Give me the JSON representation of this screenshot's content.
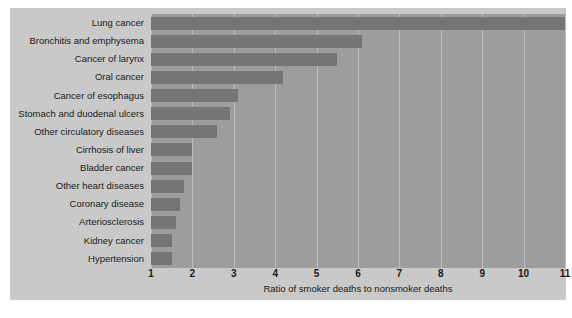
{
  "chart_data": {
    "type": "bar",
    "orientation": "horizontal",
    "title": "",
    "xlabel": "Ratio of smoker deaths to nonsmoker deaths",
    "ylabel": "",
    "xlim": [
      1,
      11
    ],
    "xticks": [
      "1",
      "2",
      "3",
      "4",
      "5",
      "6",
      "7",
      "8",
      "9",
      "10",
      "11"
    ],
    "grid": "vertical",
    "legend": "none",
    "categories": [
      "Lung cancer",
      "Bronchitis and emphysema",
      "Cancer of larynx",
      "Oral cancer",
      "Cancer of esophagus",
      "Stomach and duodenal ulcers",
      "Other circulatory diseases",
      "Cirrhosis of liver",
      "Bladder cancer",
      "Other heart diseases",
      "Coronary disease",
      "Arteriosclerosis",
      "Kidney cancer",
      "Hypertension"
    ],
    "values": [
      11.0,
      6.1,
      5.5,
      4.2,
      3.1,
      2.9,
      2.6,
      2.0,
      2.0,
      1.8,
      1.7,
      1.6,
      1.5,
      1.5
    ],
    "colors": {
      "bar": "#757575",
      "plot_background": "#9d9d9d",
      "figure_background": "#c9c9c9",
      "gridline": "#bdbdbd",
      "text": "#1a1a1a"
    }
  }
}
